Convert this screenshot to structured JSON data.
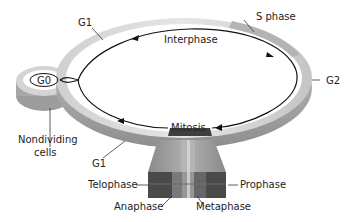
{
  "diagram": {
    "labels": {
      "g1_top": "G1",
      "s_phase": "S phase",
      "interphase": "Interphase",
      "g2": "G2",
      "g0": "G0",
      "nondividing_line1": "Nondividing",
      "nondividing_line2": "cells",
      "g1_bottom": "G1",
      "mitosis": "Mitosis",
      "telophase": "Telophase",
      "prophase": "Prophase",
      "anaphase": "Anaphase",
      "metaphase": "Metaphase"
    },
    "colors": {
      "ring_light": "#d9d9d9",
      "ring_mid": "#bdbdbd",
      "ring_dark": "#9a9a9a",
      "s_phase_band": "#a8a8a8",
      "mitosis_dark": "#4a4a4a",
      "mitosis_mid": "#7a7a7a",
      "mitosis_light": "#b5b5b5",
      "arrow": "#111111"
    }
  }
}
